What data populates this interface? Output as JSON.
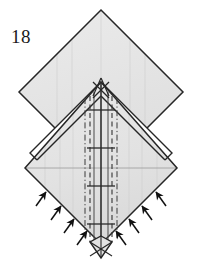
{
  "figure": {
    "kind": "origami-folding-diagram",
    "step_number": "18",
    "caption": "",
    "colors": {
      "paper_front": "#e6e6e6",
      "paper_back": "#ffffff",
      "outline": "#262626",
      "crease_valley": "#555555",
      "crease_mountain": "#3a3a3a",
      "arrow": "#111111",
      "background": "#ffffff",
      "label_text": "#1a1a1a"
    },
    "geometry": {
      "canvas_width": 200,
      "canvas_height": 266,
      "top_diamond": {
        "name": "upper-square-layer",
        "apex_top": [
          101,
          10
        ],
        "vertex_left": [
          19,
          92
        ],
        "vertex_right": [
          183,
          92
        ],
        "apex_bottom": [
          101,
          174
        ]
      },
      "bottom_diamond": {
        "name": "lower-square-layer",
        "apex_top": [
          101,
          82
        ],
        "vertex_left": [
          25,
          168
        ],
        "vertex_right": [
          177,
          168
        ],
        "apex_bottom": [
          101,
          244
        ]
      },
      "center_apex": [
        101,
        82
      ],
      "bottom_tip": [
        101,
        256
      ],
      "horizontal_midline_y": 168
    },
    "elements": {
      "arrows_left": {
        "label": "push-fold-arrows-left",
        "count": 4,
        "direction": "up-right",
        "meaning": "fold-in-edge"
      },
      "arrows_right": {
        "label": "push-fold-arrows-right",
        "count": 4,
        "direction": "up-left",
        "meaning": "fold-in-edge"
      },
      "center_column": {
        "label": "center-crease-column",
        "mountain_lines": 2,
        "valley_lines": 2,
        "center_line": 1
      },
      "tick_marks": {
        "label": "horizontal-crease-ticks",
        "count": 4,
        "y_positions": [
          110,
          148,
          186,
          224
        ]
      }
    }
  }
}
